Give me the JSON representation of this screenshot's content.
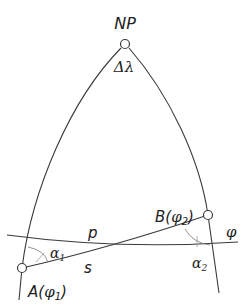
{
  "diagram": {
    "colors": {
      "stroke": "#3a3a3a",
      "text": "#222222",
      "background": "#ffffff"
    },
    "nodes": {
      "north_pole": {
        "label": "NP",
        "x": 125,
        "y": 44
      },
      "point_a": {
        "label_main": "A(",
        "label_phi": "φ",
        "label_sub": "1",
        "label_close": ")",
        "x": 22,
        "y": 268
      },
      "point_b": {
        "label_main": "B(",
        "label_phi": "φ",
        "label_sub": "2",
        "label_close": ")",
        "x": 208,
        "y": 215
      }
    },
    "labels": {
      "delta_lambda": "Δλ",
      "parallel": "p",
      "geodesic": "s",
      "latitude": "φ",
      "alpha1": "α",
      "alpha1_sub": "1",
      "alpha2": "α",
      "alpha2_sub": "2"
    }
  }
}
